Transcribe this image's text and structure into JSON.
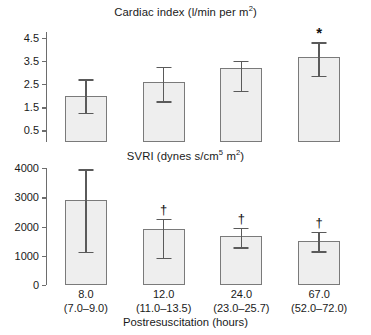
{
  "figure": {
    "xaxis_title": "Postresuscitation (hours)",
    "categories": [
      "8.0",
      "12.0",
      "24.0",
      "67.0"
    ],
    "category_ranges": [
      "(7.0–9.0)",
      "(11.0–13.5)",
      "(23.0–25.7)",
      "(52.0–72.0)"
    ],
    "marker_asterisk": "*",
    "marker_dagger": "†"
  },
  "chart_data": [
    {
      "type": "bar",
      "title": "Cardiac index (l/min per m2)",
      "title_main": "Cardiac index (l/min per m",
      "title_sup": "2",
      "title_tail": ")",
      "xlabel": "Postresuscitation (hours)",
      "ylabel": "",
      "categories": [
        "8.0",
        "12.0",
        "24.0",
        "67.0"
      ],
      "values": [
        2.0,
        2.6,
        3.2,
        3.65
      ],
      "err_low": [
        1.25,
        1.75,
        2.2,
        2.85
      ],
      "err_high": [
        2.7,
        3.25,
        3.5,
        4.3
      ],
      "annotations": [
        "",
        "",
        "",
        "*"
      ],
      "ylim": [
        0.0,
        4.75
      ],
      "yticks": [
        0.5,
        1.5,
        2.5,
        3.5,
        4.5
      ],
      "ytick_labels": [
        "0.5",
        "1.5",
        "2.5",
        "3.5",
        "4.5"
      ],
      "grid": false,
      "legend": "none"
    },
    {
      "type": "bar",
      "title": "SVRI (dynes s/cm5 m2)",
      "title_main": "SVRI (dynes s/cm",
      "title_sup": "5",
      "title_mid": " m",
      "title_sup2": "2",
      "title_tail": ")",
      "xlabel": "Postresuscitation (hours)",
      "ylabel": "",
      "categories": [
        "8.0",
        "12.0",
        "24.0",
        "67.0"
      ],
      "values": [
        2890,
        1920,
        1670,
        1500
      ],
      "err_low": [
        1140,
        930,
        1290,
        1150
      ],
      "err_high": [
        3960,
        2270,
        1950,
        1810
      ],
      "annotations": [
        "",
        "†",
        "†",
        "†"
      ],
      "ylim": [
        0,
        4000
      ],
      "yticks": [
        0,
        1000,
        2000,
        3000,
        4000
      ],
      "ytick_labels": [
        "0",
        "1000",
        "2000",
        "3000",
        "4000"
      ],
      "grid": false,
      "legend": "none"
    }
  ]
}
